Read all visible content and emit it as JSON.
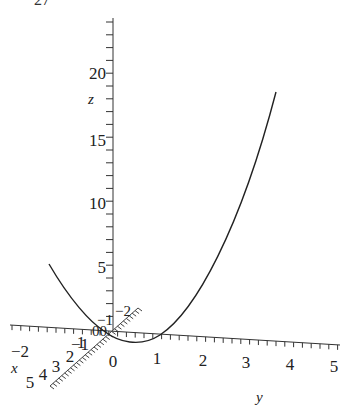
{
  "partial_label": "27",
  "chart_data": {
    "type": "line",
    "dimension": "3d",
    "title": "",
    "axes": {
      "x": {
        "label": "x",
        "ticks": [
          "5",
          "4",
          "3",
          "2",
          "1",
          "0",
          "-1",
          "-2"
        ]
      },
      "y": {
        "label": "y",
        "ticks": [
          "-2",
          "-1",
          "0",
          "1",
          "2",
          "3",
          "4",
          "5"
        ],
        "range": [
          -2,
          5
        ]
      },
      "z": {
        "label": "z",
        "ticks": [
          "5",
          "10",
          "15",
          "20"
        ],
        "range": [
          0,
          24
        ]
      }
    },
    "series": [
      {
        "name": "space curve",
        "description": "parabola-like curve z ≈ y^2 above the y-axis",
        "y": [
          -2.3,
          -1.5,
          -1,
          -0.5,
          0,
          0.5,
          1,
          1.5,
          2,
          2.5,
          3,
          3.5,
          3.7
        ],
        "z": [
          5.3,
          2.3,
          1.0,
          0.25,
          0,
          0.25,
          1.0,
          2.3,
          4.0,
          6.3,
          9.0,
          12.3,
          13.7
        ]
      }
    ],
    "grid": false,
    "legend": null
  },
  "labels": {
    "z_axis_label": "z",
    "y_axis_label": "y",
    "x_axis_label": "x",
    "z_ticks": [
      {
        "label": "20",
        "y": 74
      },
      {
        "label": "15",
        "y": 141
      },
      {
        "label": "10",
        "y": 204
      },
      {
        "label": "5",
        "y": 268
      }
    ],
    "y_ticks": [
      {
        "label": "−2",
        "x": 20
      },
      {
        "label": "−1",
        "x": 80
      },
      {
        "label": "0",
        "x": 113
      },
      {
        "label": "1",
        "x": 157
      },
      {
        "label": "2",
        "x": 203
      },
      {
        "label": "3",
        "x": 246
      },
      {
        "label": "4",
        "x": 290
      },
      {
        "label": "5",
        "x": 334
      }
    ],
    "x_ticks": [
      {
        "label": "5",
        "x": 30,
        "y": 388
      },
      {
        "label": "4",
        "x": 43,
        "y": 380
      },
      {
        "label": "3",
        "x": 56,
        "y": 372
      },
      {
        "label": "2",
        "x": 70,
        "y": 362
      },
      {
        "label": "1",
        "x": 81,
        "y": 348
      }
    ],
    "near_origin": [
      "−2",
      "−1",
      "00"
    ]
  }
}
